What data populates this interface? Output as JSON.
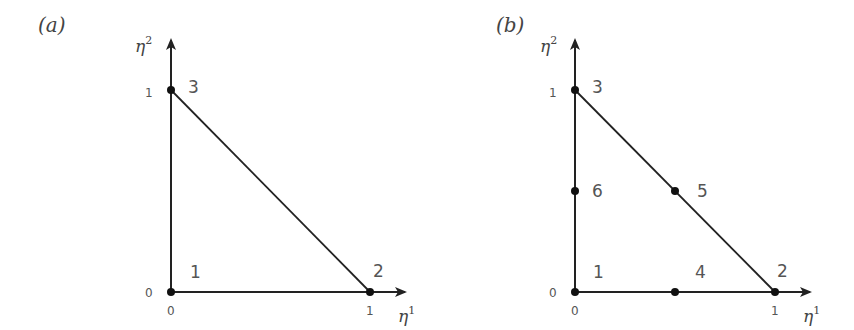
{
  "panels": [
    {
      "id": "a",
      "label": "(a)",
      "x_axis_label": "η",
      "x_axis_sup": "1",
      "y_axis_label": "η",
      "y_axis_sup": "2",
      "ticks": {
        "x": [
          "0",
          "1"
        ],
        "y": [
          "0",
          "1"
        ]
      },
      "nodes": [
        {
          "id": "1",
          "label": "1",
          "eta1": 0,
          "eta2": 0
        },
        {
          "id": "2",
          "label": "2",
          "eta1": 1,
          "eta2": 0
        },
        {
          "id": "3",
          "label": "3",
          "eta1": 0,
          "eta2": 1
        }
      ]
    },
    {
      "id": "b",
      "label": "(b)",
      "x_axis_label": "η",
      "x_axis_sup": "1",
      "y_axis_label": "η",
      "y_axis_sup": "2",
      "ticks": {
        "x": [
          "0",
          "1"
        ],
        "y": [
          "0",
          "1"
        ]
      },
      "nodes": [
        {
          "id": "1",
          "label": "1",
          "eta1": 0,
          "eta2": 0
        },
        {
          "id": "2",
          "label": "2",
          "eta1": 1,
          "eta2": 0
        },
        {
          "id": "3",
          "label": "3",
          "eta1": 0,
          "eta2": 1
        },
        {
          "id": "4",
          "label": "4",
          "eta1": 0.5,
          "eta2": 0
        },
        {
          "id": "5",
          "label": "5",
          "eta1": 0.5,
          "eta2": 0.5
        },
        {
          "id": "6",
          "label": "6",
          "eta1": 0,
          "eta2": 0.5
        }
      ]
    }
  ],
  "colors": {
    "line": "#222222",
    "text": "#555555"
  }
}
